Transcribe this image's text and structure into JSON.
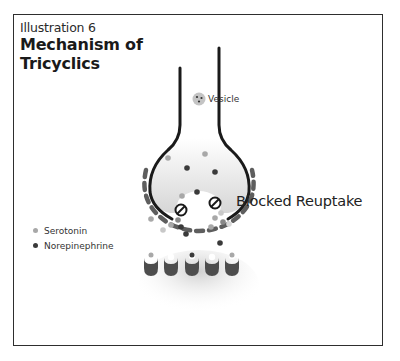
{
  "header": {
    "subtitle": "Illustration 6",
    "title": "Mechanism of Tricyclics"
  },
  "labels": {
    "vesicle": "Vesicle",
    "blocked_reuptake": "Blocked Reuptake"
  },
  "legend": {
    "items": [
      {
        "label": "Serotonin",
        "color": "#a8a8a8"
      },
      {
        "label": "Norepinephrine",
        "color": "#3a3a3a"
      }
    ]
  },
  "colors": {
    "neuron_outline": "#1a1a1a",
    "transporter": "#5e5e5e",
    "receptor": "#4d4d4d",
    "serotonin": "#a8a8a8",
    "norepinephrine": "#3a3a3a"
  }
}
